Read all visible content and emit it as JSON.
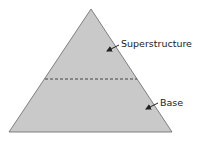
{
  "diagram": {
    "type": "pyramid",
    "colors": {
      "fill": "#c9c9c9",
      "stroke": "#555555",
      "divider": "#444444",
      "text": "#222222",
      "background": "#ffffff"
    },
    "labels": {
      "top": "Superstructure",
      "bottom": "Base"
    },
    "sections": [
      {
        "name": "Superstructure",
        "position": "upper"
      },
      {
        "name": "Base",
        "position": "lower"
      }
    ]
  }
}
